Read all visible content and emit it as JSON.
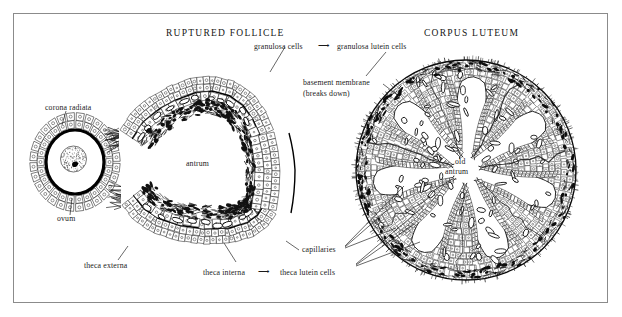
{
  "figure": {
    "type": "histology-diagram",
    "border_color": "#8b8b8b",
    "ink_color": "#111111",
    "background": "#ffffff"
  },
  "titles": {
    "ruptured_follicle": "RUPTURED FOLLICLE",
    "corpus_luteum": "CORPUS LUTEUM"
  },
  "labels": {
    "corona_radiata": "corona radiata",
    "ovum": "ovum",
    "antrum": "antrum",
    "granulosa_cells": "granulosa cells",
    "granulosa_arrow": "⟶",
    "granulosa_lutein_cells": "granulosa lutein cells",
    "basement_membrane": "basement membrane",
    "basement_membrane_note": "(breaks down)",
    "old_antrum_line1": "old",
    "old_antrum_line2": "antrum",
    "theca_externa": "theca externa",
    "theca_interna": "theca interna",
    "theca_arrow": "⟶",
    "theca_lutein_cells": "theca lutein cells",
    "capillaries": "capillaries"
  },
  "structures": {
    "ovum": {
      "name": "ovum-with-corona-radiata",
      "center": [
        75,
        162
      ],
      "corona_outer_rx": 43,
      "corona_outer_ry": 47,
      "zona_rx": 29,
      "zona_ry": 32,
      "corona_cell_count": 26,
      "ooplasm_rx": 26,
      "nucleus_rx": 13
    },
    "ruptured_follicle": {
      "name": "ruptured-follicle-wall",
      "layers": [
        "granulosa",
        "basement membrane",
        "theca interna",
        "theca externa"
      ],
      "antrum_label_pos": [
        205,
        163
      ]
    },
    "corpus_luteum": {
      "name": "corpus-luteum",
      "center": [
        466,
        170
      ],
      "radius": 110,
      "lobe_count": 7,
      "old_antrum_center": [
        466,
        170
      ]
    }
  }
}
